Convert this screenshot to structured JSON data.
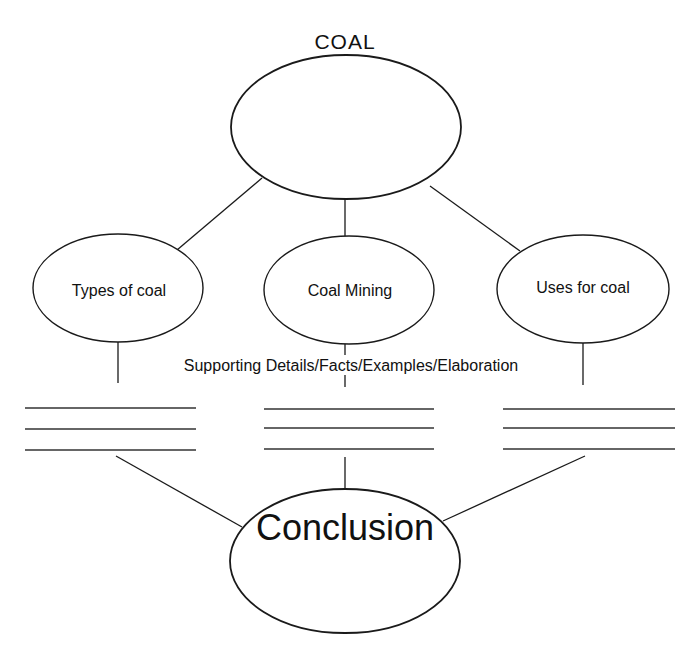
{
  "diagram": {
    "title": "COAL",
    "main_topic": {
      "label": "",
      "center": [
        346,
        127
      ],
      "rx": 115,
      "ry": 72
    },
    "subtopics": [
      {
        "id": "types",
        "label": "Types of coal",
        "center": [
          118,
          288
        ],
        "rx": 85,
        "ry": 54,
        "detail_lines_y": [
          408,
          429,
          450
        ],
        "detail_lines_x": [
          25,
          196
        ]
      },
      {
        "id": "mining",
        "label": "Coal Mining",
        "center": [
          349,
          290
        ],
        "rx": 85,
        "ry": 54,
        "detail_lines_y": [
          409,
          428,
          449
        ],
        "detail_lines_x": [
          264,
          434
        ]
      },
      {
        "id": "uses",
        "label": "Uses for coal",
        "center": [
          583,
          289
        ],
        "rx": 86,
        "ry": 54,
        "detail_lines_y": [
          409,
          428,
          449
        ],
        "detail_lines_x": [
          503,
          675
        ]
      }
    ],
    "supporting_label": "Supporting Details/Facts/Examples/Elaboration",
    "conclusion": {
      "label": "Conclusion",
      "center": [
        345,
        561
      ],
      "rx": 115,
      "ry": 72
    },
    "colors": {
      "stroke": "#1a1a1a",
      "background": "#ffffff",
      "text": "#111111"
    }
  }
}
